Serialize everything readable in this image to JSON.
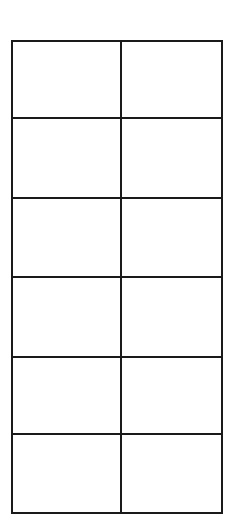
{
  "grid": {
    "rows": 6,
    "cols": 2,
    "line_color": "#1a1a1a",
    "row_dividers_y": [
      77,
      157,
      236,
      316,
      393
    ],
    "col_divider_x": 108,
    "cells": [
      [
        "",
        ""
      ],
      [
        "",
        ""
      ],
      [
        "",
        ""
      ],
      [
        "",
        ""
      ],
      [
        "",
        ""
      ],
      [
        "",
        ""
      ]
    ]
  }
}
